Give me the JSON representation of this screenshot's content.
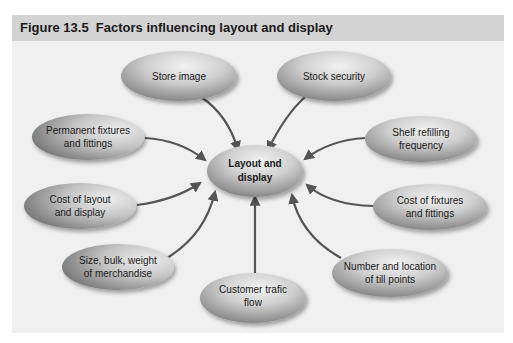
{
  "figure": {
    "title": "Figure 13.5  Factors influencing layout and display"
  },
  "diagram": {
    "center": {
      "line1": "Layout and",
      "line2": "display"
    },
    "nodes": [
      {
        "id": "store-image",
        "line1": "Store image",
        "line2": ""
      },
      {
        "id": "stock-security",
        "line1": "Stock security",
        "line2": ""
      },
      {
        "id": "permanent-fixtures",
        "line1": "Permanent fixtures",
        "line2": "and fittings"
      },
      {
        "id": "shelf-refilling",
        "line1": "Shelf refilling",
        "line2": "frequency"
      },
      {
        "id": "cost-layout",
        "line1": "Cost of layout",
        "line2": "and display"
      },
      {
        "id": "cost-fixtures",
        "line1": "Cost of fixtures",
        "line2": "and fittings"
      },
      {
        "id": "size-bulk",
        "line1": "Size, bulk, weight",
        "line2": "of merchandise"
      },
      {
        "id": "till-points",
        "line1": "Number and location",
        "line2": "of till points"
      },
      {
        "id": "customer-traffic",
        "line1": "Customer trafic",
        "line2": "flow"
      }
    ],
    "colors": {
      "header_bg": "#d3d3d3",
      "panel_bg": "#f0f0f0",
      "arrow": "#555555",
      "ellipse_light": "#e6e6e6",
      "ellipse_dark": "#8c8c8c"
    }
  }
}
